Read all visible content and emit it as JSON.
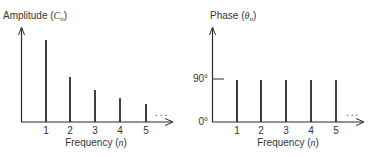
{
  "chart_data": [
    {
      "type": "bar",
      "title": "",
      "ylabel": "Amplitude (C_n)",
      "ylabel_prefix": "Amplitude (",
      "ylabel_symbol": "C",
      "ylabel_sub": "n",
      "ylabel_suffix": ")",
      "xlabel": "Frequency (n)",
      "xlabel_prefix": "Frequency (",
      "xlabel_symbol": "n",
      "xlabel_suffix": ")",
      "categories": [
        "1",
        "2",
        "3",
        "4",
        "5"
      ],
      "values": [
        1.0,
        0.55,
        0.39,
        0.29,
        0.22
      ],
      "continuation": "...",
      "grid": false,
      "legend": false
    },
    {
      "type": "bar",
      "title": "",
      "ylabel": "Phase (θ_n)",
      "ylabel_prefix": "Phase (",
      "ylabel_symbol": "θ",
      "ylabel_sub": "n",
      "ylabel_suffix": ")",
      "xlabel": "Frequency (n)",
      "xlabel_prefix": "Frequency (",
      "xlabel_symbol": "n",
      "xlabel_suffix": ")",
      "categories": [
        "1",
        "2",
        "3",
        "4",
        "5"
      ],
      "values": [
        90,
        90,
        90,
        90,
        90
      ],
      "yticks": [
        "0°",
        "90°"
      ],
      "continuation": "...",
      "grid": false,
      "legend": false
    }
  ],
  "colors": {
    "ink": "#2a2a2a",
    "background": "#ffffff"
  }
}
